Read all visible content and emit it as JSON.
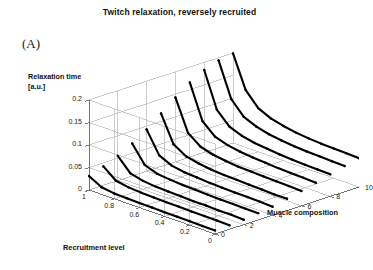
{
  "figure": {
    "panel_label": "(A)",
    "title": "Twitch relaxation, reversely recruited"
  },
  "chart_data": {
    "type": "line",
    "projection": "3d-waterfall",
    "title": "Twitch relaxation, reversely recruited",
    "xlabel": "Recruitment level",
    "ylabel": "Relaxation time [a.u.]",
    "zlabel": "Muscle composition",
    "xlim": [
      1,
      0
    ],
    "ylim": [
      0,
      0.2
    ],
    "zlim": [
      0,
      10
    ],
    "xticks": [
      "1",
      "0.8",
      "0.6",
      "0.4",
      "0.2",
      "0"
    ],
    "xtick_values": [
      1,
      0.8,
      0.6,
      0.4,
      0.2,
      0
    ],
    "yticks": [
      "0",
      "0.05",
      "0.1",
      "0.15",
      "0.2"
    ],
    "ytick_values": [
      0,
      0.05,
      0.1,
      0.15,
      0.2
    ],
    "zticks": [
      "0",
      "2",
      "4",
      "6",
      "8",
      "10"
    ],
    "ztick_values": [
      0,
      2,
      4,
      6,
      8,
      10
    ],
    "grid": true,
    "legend": "none",
    "line_color": "#000000",
    "grid_color": "#b6b6b6",
    "series_note": "One relaxation-time curve per muscle composition level; each curve falls steeply from recruitment level 1 to a low plateau.",
    "x": [
      1.0,
      0.9,
      0.8,
      0.7,
      0.6,
      0.5,
      0.4,
      0.3,
      0.2,
      0.1,
      0.0
    ],
    "series": [
      {
        "name": "composition 0",
        "z": 0,
        "values": [
          0.031,
          0.016,
          0.012,
          0.011,
          0.01,
          0.01,
          0.009,
          0.009,
          0.009,
          0.008,
          0.008
        ]
      },
      {
        "name": "composition 1",
        "z": 1,
        "values": [
          0.042,
          0.02,
          0.015,
          0.013,
          0.012,
          0.011,
          0.011,
          0.01,
          0.01,
          0.01,
          0.009
        ]
      },
      {
        "name": "composition 2",
        "z": 2,
        "values": [
          0.055,
          0.026,
          0.019,
          0.016,
          0.015,
          0.014,
          0.013,
          0.013,
          0.012,
          0.012,
          0.011
        ]
      },
      {
        "name": "composition 3",
        "z": 3,
        "values": [
          0.072,
          0.034,
          0.024,
          0.021,
          0.019,
          0.018,
          0.017,
          0.016,
          0.016,
          0.015,
          0.015
        ]
      },
      {
        "name": "composition 4",
        "z": 4,
        "values": [
          0.093,
          0.045,
          0.032,
          0.027,
          0.025,
          0.023,
          0.022,
          0.021,
          0.021,
          0.02,
          0.019
        ]
      },
      {
        "name": "composition 5",
        "z": 5,
        "values": [
          0.118,
          0.059,
          0.042,
          0.036,
          0.032,
          0.03,
          0.029,
          0.028,
          0.027,
          0.026,
          0.026
        ]
      },
      {
        "name": "composition 6",
        "z": 6,
        "values": [
          0.143,
          0.074,
          0.053,
          0.045,
          0.041,
          0.038,
          0.037,
          0.036,
          0.035,
          0.034,
          0.033
        ]
      },
      {
        "name": "composition 7",
        "z": 7,
        "values": [
          0.166,
          0.09,
          0.065,
          0.056,
          0.051,
          0.048,
          0.046,
          0.044,
          0.043,
          0.042,
          0.041
        ]
      },
      {
        "name": "composition 8",
        "z": 8,
        "values": [
          0.183,
          0.105,
          0.077,
          0.066,
          0.06,
          0.057,
          0.054,
          0.052,
          0.051,
          0.05,
          0.049
        ]
      },
      {
        "name": "composition 9",
        "z": 9,
        "values": [
          0.194,
          0.118,
          0.088,
          0.076,
          0.069,
          0.065,
          0.062,
          0.06,
          0.059,
          0.058,
          0.057
        ]
      },
      {
        "name": "composition 10",
        "z": 10,
        "values": [
          0.199,
          0.128,
          0.097,
          0.084,
          0.077,
          0.072,
          0.069,
          0.067,
          0.066,
          0.065,
          0.064
        ]
      }
    ]
  }
}
